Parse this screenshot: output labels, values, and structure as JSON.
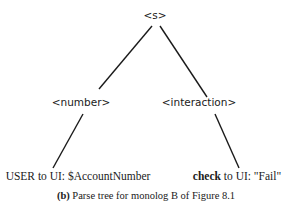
{
  "diagram": {
    "type": "parse-tree",
    "root": {
      "label": "<s>"
    },
    "nonterminals": [
      {
        "label": "<number>"
      },
      {
        "label": "<interaction>"
      }
    ],
    "leaves": [
      {
        "label": "USER to UI: $AccountNumber"
      },
      {
        "label_bold": "check",
        "label_rest": " to UI: \"Fail\""
      }
    ],
    "edges": [
      {
        "from": "<s>",
        "to": "<number>"
      },
      {
        "from": "<s>",
        "to": "<interaction>"
      },
      {
        "from": "<number>",
        "to": "USER to UI: $AccountNumber"
      },
      {
        "from": "<interaction>",
        "to": "check to UI: \"Fail\""
      }
    ],
    "line_color": "#1a1a1a"
  },
  "caption": {
    "tag": "(b)",
    "text": " Parse tree for monolog B of Figure 8.1"
  }
}
